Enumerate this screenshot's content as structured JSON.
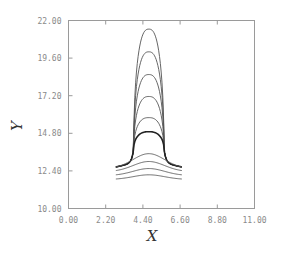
{
  "chart_data": {
    "type": "line",
    "title": "",
    "xlabel": "X",
    "ylabel": "Y",
    "xlim": [
      0.0,
      11.0
    ],
    "ylim": [
      10.0,
      22.0
    ],
    "grid": false,
    "legend": null,
    "x_ticks": [
      "0.00",
      "2.20",
      "4.40",
      "6.60",
      "8.80",
      "11.00"
    ],
    "y_ticks": [
      "10.00",
      "12.40",
      "14.80",
      "17.20",
      "19.60",
      "22.00"
    ],
    "x_tick_values": [
      0.0,
      2.2,
      4.4,
      6.6,
      8.8,
      11.0
    ],
    "y_tick_values": [
      10.0,
      12.4,
      14.8,
      17.2,
      19.6,
      22.0
    ],
    "series": [
      {
        "name": "profile-1",
        "kind": "dome",
        "x_left": 2.8,
        "x_right": 6.7,
        "center": 4.75,
        "base": 12.9,
        "peak": 21.45
      },
      {
        "name": "profile-2",
        "kind": "dome",
        "x_left": 2.8,
        "x_right": 6.7,
        "center": 4.75,
        "base": 12.9,
        "peak": 20.0
      },
      {
        "name": "profile-3",
        "kind": "dome",
        "x_left": 2.8,
        "x_right": 6.7,
        "center": 4.75,
        "base": 12.9,
        "peak": 18.55
      },
      {
        "name": "profile-4",
        "kind": "dome",
        "x_left": 2.8,
        "x_right": 6.7,
        "center": 4.75,
        "base": 12.9,
        "peak": 17.15
      },
      {
        "name": "profile-5",
        "kind": "dome",
        "x_left": 2.8,
        "x_right": 6.7,
        "center": 4.75,
        "base": 12.9,
        "peak": 15.8
      },
      {
        "name": "profile-6",
        "kind": "dome",
        "x_left": 2.8,
        "x_right": 6.7,
        "center": 4.75,
        "base": 12.9,
        "peak": 14.9
      },
      {
        "name": "profile-7",
        "kind": "bell",
        "x_left": 2.8,
        "x_right": 6.7,
        "center": 4.75,
        "base": 12.55,
        "peak": 13.5
      },
      {
        "name": "profile-8",
        "kind": "bell",
        "x_left": 2.8,
        "x_right": 6.7,
        "center": 4.75,
        "base": 12.35,
        "peak": 13.0
      },
      {
        "name": "profile-9",
        "kind": "bell",
        "x_left": 2.8,
        "x_right": 6.7,
        "center": 4.75,
        "base": 12.1,
        "peak": 12.55
      },
      {
        "name": "profile-10",
        "kind": "bell",
        "x_left": 2.8,
        "x_right": 6.7,
        "center": 4.75,
        "base": 11.85,
        "peak": 12.15
      }
    ]
  },
  "axes": {
    "x_title": "X",
    "y_title": "Y"
  }
}
